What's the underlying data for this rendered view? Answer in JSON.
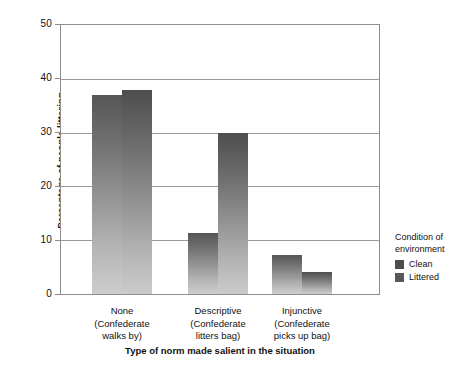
{
  "top_artifact": {
    "text": "decorative cut-off text line"
  },
  "legend": {
    "title_line1": "Condition of",
    "title_line2": "environment",
    "entries": [
      {
        "label": "Clean",
        "swatch": "clean-swatch"
      },
      {
        "label": "Littered",
        "swatch": "littered-swatch"
      }
    ]
  },
  "axis": {
    "y_title": "Percentage of people littering",
    "x_title": "Type of norm made salient in the situation",
    "y_ticks": [
      "0",
      "10",
      "20",
      "30",
      "40",
      "50"
    ]
  },
  "x_groups": [
    {
      "category": "None",
      "sub_line1": "(Confederate",
      "sub_line2": "walks by)"
    },
    {
      "category": "Descriptive",
      "sub_line1": "(Confederate",
      "sub_line2": "litters bag)"
    },
    {
      "category": "Injunctive",
      "sub_line1": "(Confederate",
      "sub_line2": "picks up bag)"
    }
  ],
  "chart_data": {
    "type": "bar",
    "title": "",
    "xlabel": "Type of norm made salient in the situation",
    "ylabel": "Percentage of people littering",
    "categories": [
      "None (Confederate walks by)",
      "Descriptive (Confederate litters bag)",
      "Injunctive (Confederate picks up bag)"
    ],
    "series": [
      {
        "name": "Clean",
        "values": [
          37,
          11.3,
          7.2
        ],
        "color": "#808080"
      },
      {
        "name": "Littered",
        "values": [
          38,
          30,
          4.1
        ],
        "color": "#7a7a7a"
      }
    ],
    "ylim": [
      0,
      50
    ],
    "ytick_values": [
      0,
      10,
      20,
      30,
      40,
      50
    ],
    "grid": true,
    "legend_position": "right",
    "legend_title": "Condition of environment"
  }
}
